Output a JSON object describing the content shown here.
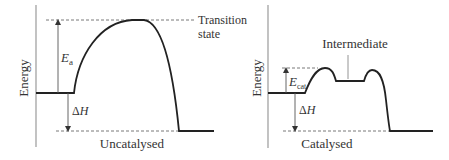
{
  "panels": [
    {
      "id": "uncatalysed",
      "caption": "Uncatalysed",
      "y_axis_label": "Energy",
      "activation_label": {
        "main": "E",
        "sub": "a"
      },
      "enthalpy_label": {
        "delta": "Δ",
        "var": "H"
      },
      "annotation_line1": "Transition",
      "annotation_line2": "state"
    },
    {
      "id": "catalysed",
      "caption": "Catalysed",
      "y_axis_label": "Energy",
      "activation_label": {
        "main": "E",
        "sub": "cat"
      },
      "enthalpy_label": {
        "delta": "Δ",
        "var": "H"
      },
      "annotation": "Intermediate"
    }
  ],
  "colors": {
    "curve": "#222222",
    "axis": "#9a9a9a",
    "dashed": "#555555",
    "text": "#333333"
  }
}
